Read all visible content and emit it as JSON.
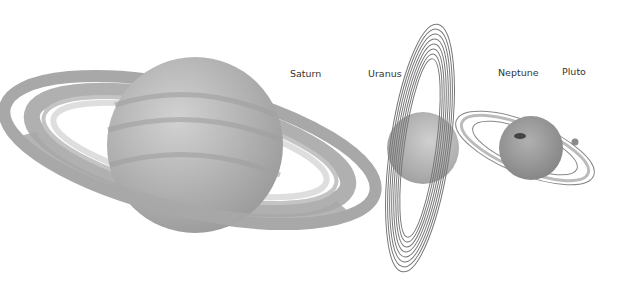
{
  "diagram": {
    "type": "planet-ring-comparison",
    "colors": {
      "background": "#ffffff",
      "planet": "#b5b5b5",
      "ring": "#aaaaaa",
      "label": "#333333"
    },
    "labels": {
      "saturn": "Saturn",
      "uranus": "Uranus",
      "neptune": "Neptune",
      "pluto": "Pluto"
    }
  }
}
